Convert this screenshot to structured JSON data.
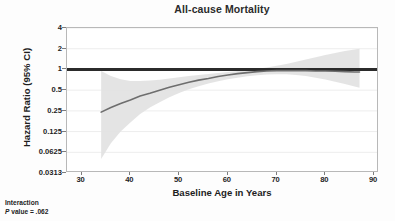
{
  "chart_data": {
    "type": "line",
    "title": "All-cause Mortality",
    "xlabel": "Baseline Age in Years",
    "ylabel": "Hazard Ratio (95% CI)",
    "xlim": [
      27,
      91
    ],
    "ylim": [
      0.0313,
      4
    ],
    "yscale": "log2",
    "grid": true,
    "legend": null,
    "x_ticks": [
      30,
      40,
      50,
      60,
      70,
      80,
      90
    ],
    "x_tick_labels": [
      "30",
      "40",
      "50",
      "60",
      "70",
      "80",
      "90"
    ],
    "y_ticks": [
      4,
      2,
      1,
      0.5,
      0.25,
      0.125,
      0.0625,
      0.0313
    ],
    "y_tick_labels": [
      "4",
      "2",
      "1",
      "0.5",
      "0.25",
      "0.125",
      "0.0625",
      "0.0313"
    ],
    "reference_line": {
      "y": 1,
      "color": "#2b2b2b",
      "width": 3
    },
    "series": [
      {
        "name": "Hazard Ratio",
        "type": "line",
        "color": "#6e6e6e",
        "x": [
          34,
          36,
          38,
          40,
          42,
          44,
          46,
          48,
          50,
          52,
          54,
          56,
          58,
          60,
          62,
          64,
          66,
          68,
          70,
          72,
          74,
          76,
          78,
          80,
          82,
          84,
          86,
          87
        ],
        "values": [
          0.24,
          0.28,
          0.32,
          0.36,
          0.41,
          0.45,
          0.5,
          0.55,
          0.6,
          0.65,
          0.7,
          0.74,
          0.79,
          0.83,
          0.87,
          0.9,
          0.93,
          0.95,
          0.96,
          0.96,
          0.96,
          0.96,
          0.95,
          0.95,
          0.94,
          0.93,
          0.92,
          0.92
        ]
      },
      {
        "name": "95% CI Upper",
        "type": "band-upper",
        "color": "#e2e2e2",
        "x": [
          34,
          36,
          38,
          40,
          42,
          44,
          46,
          48,
          50,
          52,
          54,
          56,
          58,
          60,
          62,
          64,
          66,
          68,
          70,
          72,
          74,
          76,
          78,
          80,
          82,
          84,
          86,
          87
        ],
        "values": [
          0.95,
          0.8,
          0.72,
          0.68,
          0.68,
          0.69,
          0.71,
          0.74,
          0.77,
          0.8,
          0.83,
          0.86,
          0.89,
          0.92,
          0.95,
          0.98,
          1.02,
          1.07,
          1.13,
          1.2,
          1.29,
          1.39,
          1.5,
          1.62,
          1.74,
          1.85,
          1.95,
          2.0
        ]
      },
      {
        "name": "95% CI Lower",
        "type": "band-lower",
        "color": "#e2e2e2",
        "x": [
          34,
          36,
          38,
          40,
          42,
          44,
          46,
          48,
          50,
          52,
          54,
          56,
          58,
          60,
          62,
          64,
          66,
          68,
          70,
          72,
          74,
          76,
          78,
          80,
          82,
          84,
          86,
          87
        ],
        "values": [
          0.05,
          0.085,
          0.125,
          0.17,
          0.225,
          0.28,
          0.335,
          0.395,
          0.455,
          0.515,
          0.57,
          0.625,
          0.675,
          0.72,
          0.76,
          0.795,
          0.825,
          0.845,
          0.855,
          0.85,
          0.83,
          0.8,
          0.76,
          0.715,
          0.665,
          0.615,
          0.565,
          0.54
        ]
      }
    ],
    "annotations": [
      {
        "name": "interaction-p-value",
        "line1": "Interaction",
        "line2_prefix": "P",
        "line2_suffix": " value = .062"
      }
    ]
  }
}
